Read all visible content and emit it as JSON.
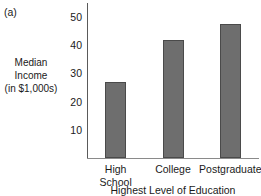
{
  "panel": {
    "label": "(a)"
  },
  "chart_data": {
    "type": "bar",
    "title": "",
    "subtitle": "",
    "categories": [
      "High School",
      "College",
      "Postgraduate"
    ],
    "category_lines": [
      [
        "High",
        "School"
      ],
      [
        "College"
      ],
      [
        "Postgraduate"
      ]
    ],
    "values": [
      27,
      42,
      47.5
    ],
    "xlabel": "Highest Level of Education",
    "ylabel": "Median Income (in $1,000s)",
    "ylabel_lines": [
      "Median",
      "Income",
      "(in $1,000s)"
    ],
    "yticks": [
      10,
      20,
      30,
      40,
      50
    ],
    "ytick_labels": [
      "10",
      "20",
      "30",
      "40",
      "50"
    ],
    "ylim": [
      0,
      55
    ],
    "grid": false,
    "legend": null,
    "bar_color": "#6e6e6e",
    "bar_edge_color": "#4a4a4a",
    "axis_color": "#5a5a5a",
    "background": "#ffffff"
  }
}
